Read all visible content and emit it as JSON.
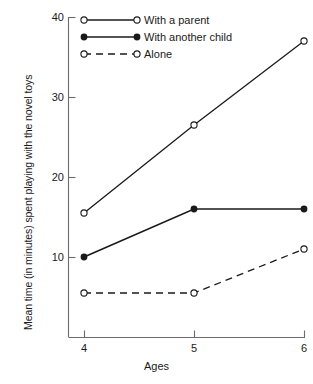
{
  "chart_data": {
    "type": "line",
    "title": "",
    "xlabel": "Ages",
    "ylabel": "Mean time (in minutes) spent playing with the novel toys",
    "categories": [
      "4",
      "5",
      "6"
    ],
    "x": [
      4,
      5,
      6
    ],
    "xlim": [
      3.6,
      6.15
    ],
    "ylim": [
      0,
      40
    ],
    "yticks": [
      10,
      20,
      30,
      40
    ],
    "xticks": [
      4,
      5,
      6
    ],
    "grid": false,
    "legend_position": "top-center",
    "series": [
      {
        "name": "With a parent",
        "values": [
          15.5,
          26.5,
          37
        ],
        "marker": "open-circle",
        "linestyle": "solid",
        "color": "#1a1a1a"
      },
      {
        "name": "With another child",
        "values": [
          10,
          16,
          16
        ],
        "marker": "filled-circle",
        "linestyle": "solid",
        "color": "#1a1a1a"
      },
      {
        "name": "Alone",
        "values": [
          5.5,
          5.5,
          11
        ],
        "marker": "open-circle",
        "linestyle": "dashed",
        "color": "#1a1a1a"
      }
    ]
  },
  "axes": {
    "ytick_labels": [
      "40",
      "30",
      "20",
      "10"
    ],
    "xtick_labels": [
      "4",
      "5",
      "6"
    ],
    "ylabel": "Mean time (in minutes) spent playing with the novel toys",
    "xlabel": "Ages"
  },
  "legend": {
    "items": [
      {
        "label": "With a parent"
      },
      {
        "label": "With another child"
      },
      {
        "label": "Alone"
      }
    ]
  },
  "style": {
    "axis_color": "#6b6b6b",
    "line_color": "#1a1a1a",
    "background": "#ffffff"
  }
}
